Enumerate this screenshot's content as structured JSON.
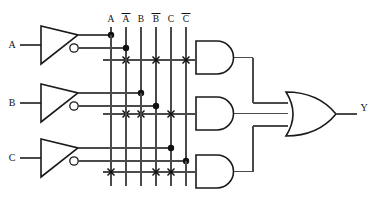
{
  "diagram": {
    "inputs": [
      {
        "id": "A",
        "label": "A",
        "y": 45
      },
      {
        "id": "B",
        "label": "B",
        "y": 103
      },
      {
        "id": "C",
        "label": "C",
        "y": 158
      }
    ],
    "output": {
      "id": "Y",
      "label": "Y",
      "y": 114
    },
    "bus_labels": [
      {
        "id": "bus-A",
        "label": "A",
        "bar": false,
        "x": 111
      },
      {
        "id": "bus-Anot",
        "label": "A",
        "bar": true,
        "x": 126
      },
      {
        "id": "bus-B",
        "label": "B",
        "bar": false,
        "x": 141
      },
      {
        "id": "bus-Bnot",
        "label": "B",
        "bar": true,
        "x": 156
      },
      {
        "id": "bus-C",
        "label": "C",
        "bar": false,
        "x": 171
      },
      {
        "id": "bus-Cnot",
        "label": "C",
        "bar": true,
        "x": 186
      }
    ],
    "buffers": [
      {
        "id": "buf-A",
        "name": "inverter-buffer-a",
        "true_out": "A",
        "inv_out": "A-bar"
      },
      {
        "id": "buf-B",
        "name": "inverter-buffer-b",
        "true_out": "B",
        "inv_out": "B-bar"
      },
      {
        "id": "buf-C",
        "name": "inverter-buffer-c",
        "true_out": "C",
        "inv_out": "C-bar"
      }
    ],
    "and_gates": [
      {
        "id": "and-1",
        "name": "and-gate-1",
        "product": "A B C",
        "connects": [
          "A",
          "B",
          "C"
        ],
        "crosses": [
          "A-bar",
          "B-bar",
          "C-bar"
        ]
      },
      {
        "id": "and-2",
        "name": "and-gate-2",
        "product": "A B-bar C-bar",
        "connects": [
          "A",
          "B-bar",
          "C-bar"
        ],
        "crosses": [
          "A-bar",
          "B",
          "C"
        ]
      },
      {
        "id": "and-3",
        "name": "and-gate-3",
        "product": "A-bar B C-bar",
        "connects": [
          "A-bar",
          "B",
          "C-bar"
        ],
        "crosses": [
          "A",
          "B-bar",
          "C"
        ]
      }
    ],
    "or_gate": {
      "id": "or-1",
      "name": "or-gate",
      "inputs": 3,
      "output": "Y"
    }
  }
}
